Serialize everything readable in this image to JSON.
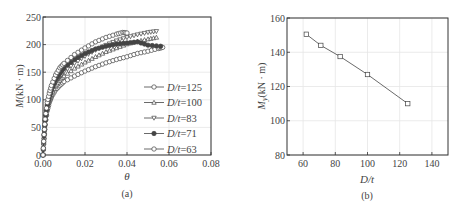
{
  "chart_data": [
    {
      "panel": "(a)",
      "type": "line",
      "xlabel": "θ",
      "ylabel": "M(kN · m)",
      "xlim": [
        0,
        0.08
      ],
      "ylim": [
        0,
        250
      ],
      "xticks": [
        "0.00",
        "0.02",
        "0.04",
        "0.06",
        "0.08"
      ],
      "yticks": [
        "0",
        "50",
        "100",
        "150",
        "200",
        "250"
      ],
      "grid": true,
      "legend_position": "lower right",
      "series": [
        {
          "name": "D/t=125",
          "marker": "circle-open",
          "x": [
            0,
            0.0005,
            0.001,
            0.002,
            0.003,
            0.004,
            0.006,
            0.008,
            0.01,
            0.015,
            0.02,
            0.025,
            0.03,
            0.035,
            0.04,
            0.045,
            0.05,
            0.055,
            0.057
          ],
          "y": [
            0,
            30,
            55,
            80,
            95,
            105,
            118,
            126,
            133,
            143,
            152,
            160,
            167,
            173,
            178,
            184,
            188,
            193,
            195
          ]
        },
        {
          "name": "D/t=100",
          "marker": "triangle-up-open",
          "x": [
            0,
            0.0005,
            0.001,
            0.002,
            0.003,
            0.004,
            0.006,
            0.008,
            0.01,
            0.015,
            0.02,
            0.025,
            0.03,
            0.035,
            0.04,
            0.045,
            0.05,
            0.054
          ],
          "y": [
            0,
            32,
            58,
            85,
            100,
            110,
            125,
            135,
            143,
            157,
            168,
            178,
            187,
            194,
            201,
            206,
            210,
            213
          ]
        },
        {
          "name": "D/t=83",
          "marker": "triangle-down-open",
          "x": [
            0,
            0.0005,
            0.001,
            0.002,
            0.003,
            0.004,
            0.006,
            0.008,
            0.01,
            0.015,
            0.02,
            0.025,
            0.03,
            0.035,
            0.04,
            0.045,
            0.05,
            0.054
          ],
          "y": [
            0,
            34,
            60,
            88,
            103,
            114,
            131,
            142,
            151,
            166,
            179,
            190,
            199,
            207,
            213,
            218,
            222,
            224
          ]
        },
        {
          "name": "D/t=71",
          "marker": "star-filled",
          "x": [
            0,
            0.0005,
            0.001,
            0.002,
            0.003,
            0.004,
            0.006,
            0.008,
            0.01,
            0.015,
            0.02,
            0.025,
            0.03,
            0.035,
            0.04,
            0.045,
            0.05,
            0.056
          ],
          "y": [
            0,
            35,
            62,
            90,
            106,
            118,
            136,
            148,
            158,
            173,
            184,
            192,
            197,
            201,
            203,
            205,
            199,
            197
          ]
        },
        {
          "name": "D/t=63",
          "marker": "circle-open",
          "x": [
            0,
            0.0005,
            0.001,
            0.002,
            0.003,
            0.004,
            0.006,
            0.008,
            0.01,
            0.015,
            0.02,
            0.025,
            0.03,
            0.035,
            0.038,
            0.04
          ],
          "y": [
            0,
            37,
            65,
            95,
            112,
            126,
            145,
            158,
            166,
            182,
            194,
            205,
            213,
            219,
            222,
            221
          ]
        },
        {
          "name": "D/t=63 (extended)",
          "marker": "none",
          "x": [],
          "y": []
        }
      ]
    },
    {
      "panel": "(b)",
      "type": "line",
      "xlabel": "D/t",
      "ylabel": "My(kN · m)",
      "xlim": [
        50,
        150
      ],
      "ylim": [
        80,
        160
      ],
      "xticks": [
        "60",
        "80",
        "100",
        "120",
        "140"
      ],
      "yticks": [
        "80",
        "100",
        "120",
        "140",
        "160"
      ],
      "grid": true,
      "series": [
        {
          "name": "My",
          "marker": "square-open",
          "x": [
            62,
            71,
            83,
            100,
            125
          ],
          "y": [
            150.5,
            144,
            137.5,
            127,
            110
          ]
        }
      ]
    }
  ],
  "labels": {
    "a": {
      "caption": "(a)",
      "xlabel": "θ",
      "ylabel_main": "M",
      "ylabel_unit": "(kN · m)",
      "xticks": [
        "0.00",
        "0.02",
        "0.04",
        "0.06",
        "0.08"
      ],
      "yticks": [
        "0",
        "50",
        "100",
        "150",
        "200",
        "250"
      ],
      "legend": [
        "D/t=125",
        "D/t=100",
        "D/t=83",
        "D/t=71",
        "D/t=63"
      ]
    },
    "b": {
      "caption": "(b)",
      "xlabel": "D/t",
      "ylabel_main": "M",
      "ylabel_sub": "y",
      "ylabel_unit": "(kN · m)",
      "xticks": [
        "60",
        "80",
        "100",
        "120",
        "140"
      ],
      "yticks": [
        "80",
        "100",
        "120",
        "140",
        "160"
      ]
    }
  },
  "colors": {
    "line": "#444444",
    "axis": "#333333",
    "grid": "#e6e6e6",
    "text": "#444444"
  }
}
